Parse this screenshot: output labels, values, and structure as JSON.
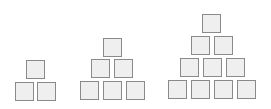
{
  "diagram": {
    "colors": {
      "fill": "#efefef",
      "border": "#8a8a8a",
      "background": "#ffffff"
    },
    "pyramids": [
      {
        "name": "pyramid-1",
        "rows": 2,
        "square_count": 3,
        "squares": [
          {
            "x": 26,
            "y": 60
          },
          {
            "x": 15,
            "y": 82
          },
          {
            "x": 37,
            "y": 82
          }
        ]
      },
      {
        "name": "pyramid-2",
        "rows": 3,
        "square_count": 6,
        "squares": [
          {
            "x": 103,
            "y": 38
          },
          {
            "x": 91,
            "y": 59
          },
          {
            "x": 114,
            "y": 59
          },
          {
            "x": 80,
            "y": 81
          },
          {
            "x": 103,
            "y": 81
          },
          {
            "x": 126,
            "y": 81
          }
        ]
      },
      {
        "name": "pyramid-3",
        "rows": 4,
        "square_count": 10,
        "squares": [
          {
            "x": 202,
            "y": 14
          },
          {
            "x": 191,
            "y": 36
          },
          {
            "x": 214,
            "y": 36
          },
          {
            "x": 180,
            "y": 58
          },
          {
            "x": 203,
            "y": 58
          },
          {
            "x": 226,
            "y": 58
          },
          {
            "x": 168,
            "y": 80
          },
          {
            "x": 191,
            "y": 80
          },
          {
            "x": 214,
            "y": 80
          },
          {
            "x": 237,
            "y": 80
          }
        ]
      }
    ]
  }
}
